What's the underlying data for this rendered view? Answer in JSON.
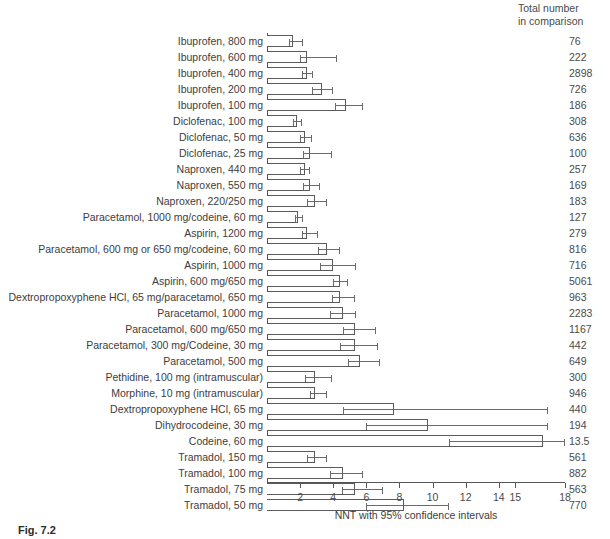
{
  "figure": {
    "totals_header": "Total number\nin comparison",
    "caption": "Fig. 7.2",
    "axis_title": "NNT with 95% confidence intervals"
  },
  "chart_data": {
    "type": "bar",
    "orientation": "horizontal",
    "title": "",
    "xlabel": "NNT with 95% confidence intervals",
    "ylabel": "",
    "xlim": [
      0,
      18
    ],
    "grid": false,
    "legend": null,
    "xticks": [
      2,
      4,
      6,
      8,
      10,
      12,
      14,
      15,
      18
    ],
    "xtick_labels": [
      "2",
      "4",
      "6",
      "8",
      "10",
      "12",
      "14",
      "15",
      "18"
    ],
    "extra_column": {
      "header": "Total number in comparison",
      "values": [
        76,
        222,
        2898,
        726,
        186,
        308,
        636,
        100,
        257,
        169,
        183,
        127,
        279,
        816,
        716,
        5061,
        963,
        2283,
        1167,
        442,
        649,
        300,
        946,
        440,
        194,
        13.5,
        561,
        882,
        563,
        770
      ]
    },
    "categories": [
      "Ibuprofen, 800 mg",
      "Ibuprofen, 600 mg",
      "Ibuprofen, 400 mg",
      "Ibuprofen, 200 mg",
      "Ibuprofen, 100 mg",
      "Diclofenac, 100 mg",
      "Diclofenac, 50 mg",
      "Diclofenac, 25 mg",
      "Naproxen, 440 mg",
      "Naproxen, 550 mg",
      "Naproxen, 220/250 mg",
      "Paracetamol, 1000 mg/codeine, 60 mg",
      "Aspirin, 1200 mg",
      "Paracetamol, 600 mg or 650 mg/codeine, 60 mg",
      "Aspirin, 1000 mg",
      "Aspirin, 600 mg/650 mg",
      "Dextropropoxyphene HCl, 65 mg/paracetamol, 650 mg",
      "Paracetamol, 1000 mg",
      "Paracetamol, 600 mg/650 mg",
      "Paracetamol, 300 mg/Codeine, 30 mg",
      "Paracetamol, 500 mg",
      "Pethidine, 100 mg (intramuscular)",
      "Morphine, 10 mg (intramuscular)",
      "Dextropropoxyphene HCl, 65 mg",
      "Dihydrocodeine, 30 mg",
      "Codeine, 60 mg",
      "Tramadol, 150 mg",
      "Tramadol, 100 mg",
      "Tramadol, 75 mg",
      "Tramadol, 50 mg"
    ],
    "values": [
      1.6,
      2.4,
      2.4,
      3.3,
      4.8,
      1.8,
      2.3,
      2.6,
      2.3,
      2.6,
      2.9,
      1.9,
      2.4,
      3.6,
      4.0,
      4.4,
      4.4,
      4.6,
      5.3,
      5.3,
      5.6,
      2.9,
      2.9,
      7.7,
      9.7,
      16.7,
      2.9,
      4.6,
      5.3,
      8.3
    ],
    "totals": [
      76,
      222,
      2898,
      726,
      186,
      308,
      636,
      100,
      257,
      169,
      183,
      127,
      279,
      816,
      716,
      5061,
      963,
      2283,
      1167,
      442,
      649,
      300,
      946,
      440,
      194,
      13.5,
      561,
      882,
      563,
      770
    ],
    "ci_low": [
      1.3,
      2.0,
      2.1,
      2.7,
      4.1,
      1.6,
      2.0,
      2.2,
      2.0,
      2.2,
      2.4,
      1.7,
      2.1,
      3.1,
      3.2,
      4.0,
      3.9,
      3.8,
      4.6,
      4.4,
      4.9,
      2.3,
      2.6,
      4.6,
      6.0,
      11.0,
      2.4,
      3.8,
      4.5,
      6.0
    ],
    "ci_high": [
      2.2,
      4.2,
      2.8,
      4.0,
      5.8,
      2.1,
      2.7,
      3.9,
      2.6,
      3.2,
      3.6,
      2.2,
      3.1,
      4.4,
      5.4,
      4.9,
      5.3,
      5.4,
      6.6,
      6.7,
      6.8,
      3.9,
      3.6,
      17.0,
      17.0,
      24.0,
      3.6,
      5.8,
      7.0,
      11.0
    ]
  }
}
